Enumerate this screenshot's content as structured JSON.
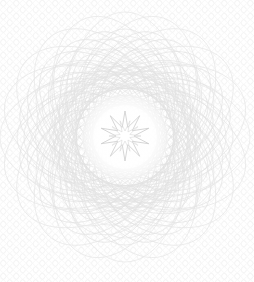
{
  "document": {
    "title": "Guilloche Security Rosette",
    "kind": "security-watermark-pattern",
    "width": 254,
    "height": 282,
    "background_color": "#ffffff"
  },
  "colors": {
    "page_background": "#ffffff",
    "lattice_stroke": "#f2f2f2",
    "rosette_stroke": "#e6e6e6",
    "rosette_stroke_faint": "#ececec",
    "rosette_stroke_dense": "#dddddd",
    "inner_ring_stroke": "#e0e0e0",
    "star_stroke": "#cfcfcf",
    "clear_zone_fill": "#fcfcfc"
  },
  "background_lattice": {
    "name": "diamond-oval-lattice",
    "tile_width": 13,
    "tile_height": 13,
    "stroke_width": 0.6,
    "opacity": 0.85,
    "description": "Repeating faint chain of ovals and diamonds covering the full canvas"
  },
  "rosette": {
    "name": "spirograph-rosette",
    "center_x": 125,
    "center_y": 137,
    "outer_radius_x": 122,
    "outer_radius_y": 126,
    "petal_count": 20,
    "bounds": {
      "top": 18,
      "bottom": 264,
      "left": 3,
      "right": 249
    },
    "layers": [
      {
        "name": "outer-petal-ring",
        "curve_count": 20,
        "ellipse_rx": 63,
        "ellipse_ry": 113,
        "offset": 12,
        "stroke": "#e8e8e8",
        "stroke_width": 0.75
      },
      {
        "name": "mid-petal-ring",
        "curve_count": 24,
        "ellipse_rx": 50,
        "ellipse_ry": 90,
        "offset": 18,
        "stroke": "#e4e4e4",
        "stroke_width": 0.7
      },
      {
        "name": "inner-dense-ring",
        "curve_count": 28,
        "ellipse_rx": 36,
        "ellipse_ry": 66,
        "offset": 24,
        "stroke": "#e2e2e2",
        "stroke_width": 0.6
      },
      {
        "name": "core-weave-ring",
        "curve_count": 30,
        "ellipse_rx": 24,
        "ellipse_ry": 46,
        "offset": 30,
        "stroke": "#e0e0e0",
        "stroke_width": 0.55
      }
    ]
  },
  "clear_zone": {
    "name": "center-clear-disc",
    "center_x": 125,
    "center_y": 137,
    "radius": 42,
    "fill": "#fdfdfd",
    "description": "Light circular reserve area that masks the dense guilloche behind the star"
  },
  "center_star": {
    "name": "ten-point-star",
    "center_x": 125,
    "center_y": 136,
    "point_count": 10,
    "outer_radius": 25,
    "inner_radius": 9,
    "stroke": "#cccccc",
    "stroke_width": 0.8,
    "fill": "none",
    "inner_rosette": {
      "name": "star-inner-rosette",
      "point_count": 10,
      "outer_radius": 16,
      "inner_radius": 5,
      "stroke": "#d8d8d8",
      "stroke_width": 0.6
    }
  },
  "accessibility": {
    "alt_text": "Very faint light-grey guilloche rosette security pattern on a white background with a fine diamond lattice texture and a ten-pointed star at the centre"
  }
}
